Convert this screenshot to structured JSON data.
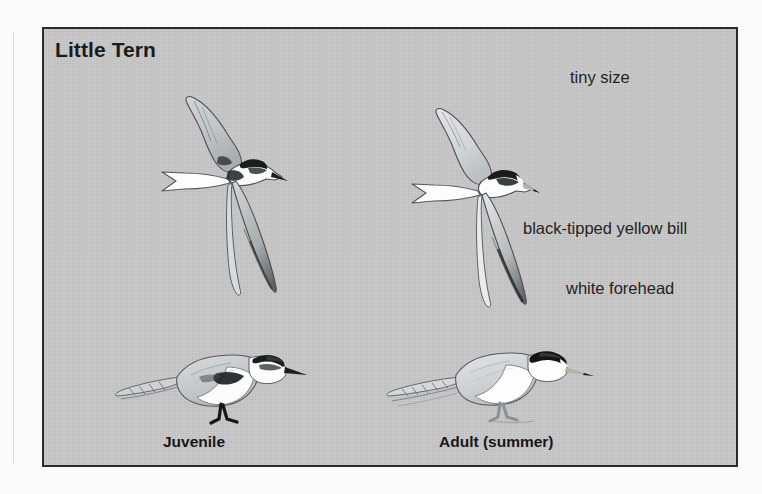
{
  "plate": {
    "title": "Little Tern",
    "background_color": "#c5c5c5",
    "border_color": "#2a2a2a",
    "page_background_color": "#fbfbfb"
  },
  "annotations": [
    {
      "id": "tiny-size",
      "text": "tiny size"
    },
    {
      "id": "black-tipped-yellow-bill",
      "text": "black-tipped yellow bill"
    },
    {
      "id": "white-forehead",
      "text": "white forehead"
    }
  ],
  "captions": [
    {
      "id": "juvenile",
      "text": "Juvenile"
    },
    {
      "id": "adult-summer",
      "text": "Adult (summer)"
    }
  ],
  "illustrations": [
    {
      "id": "flying-juvenile",
      "name": "little-tern-juvenile-in-flight",
      "plumage": "juvenile",
      "pose": "flight"
    },
    {
      "id": "flying-adult",
      "name": "little-tern-adult-in-flight",
      "plumage": "adult summer",
      "pose": "flight"
    },
    {
      "id": "perched-juvenile",
      "name": "little-tern-juvenile-perched",
      "plumage": "juvenile",
      "pose": "perched"
    },
    {
      "id": "perched-adult",
      "name": "little-tern-adult-perched",
      "plumage": "adult summer",
      "pose": "perched"
    }
  ],
  "colors": {
    "ink": "#232323",
    "cap_black": "#1d1d1d",
    "body_white": "#fdfdfd",
    "wing_grey": "#b9bcbd",
    "wing_shadow": "#8e9294"
  }
}
